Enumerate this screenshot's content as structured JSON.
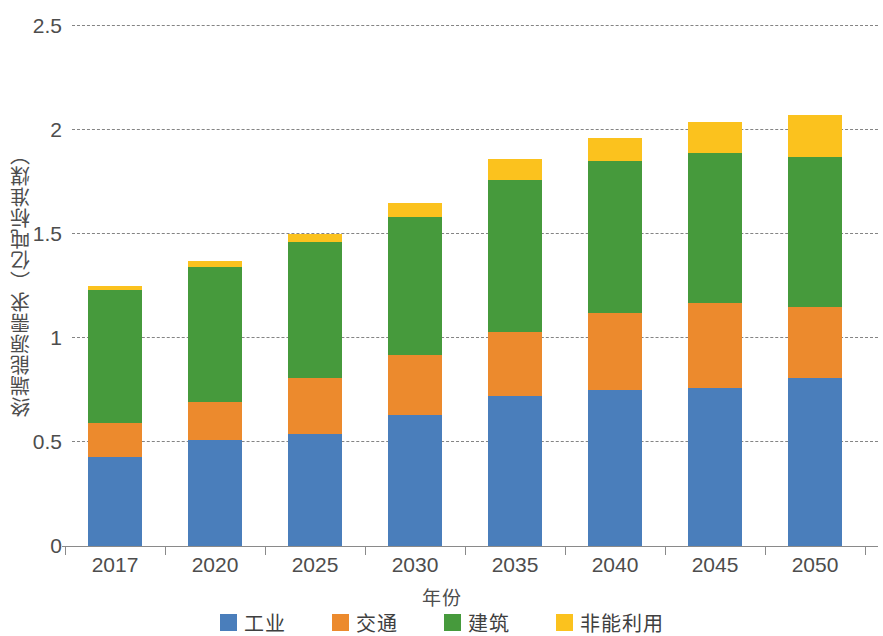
{
  "chart_data": {
    "type": "bar",
    "stacked": true,
    "title": "",
    "xlabel": "年份",
    "ylabel": "终端能源需求（亿吨标准煤）",
    "categories": [
      "2017",
      "2020",
      "2025",
      "2030",
      "2035",
      "2040",
      "2045",
      "2050"
    ],
    "ylim": [
      0,
      2.5
    ],
    "yticks": [
      0,
      0.5,
      1,
      1.5,
      2,
      2.5
    ],
    "ytick_labels": [
      "0",
      "0.5",
      "1",
      "1.5",
      "2",
      "2.5"
    ],
    "grid": true,
    "grid_axis": "y",
    "legend_position": "bottom",
    "series": [
      {
        "name": "工业",
        "color": "#4a7ebb",
        "values": [
          0.43,
          0.51,
          0.54,
          0.63,
          0.72,
          0.75,
          0.76,
          0.81
        ]
      },
      {
        "name": "交通",
        "color": "#ec8a2d",
        "values": [
          0.16,
          0.18,
          0.27,
          0.29,
          0.31,
          0.37,
          0.41,
          0.34
        ]
      },
      {
        "name": "建筑",
        "color": "#469a3c",
        "values": [
          0.64,
          0.65,
          0.65,
          0.66,
          0.73,
          0.73,
          0.72,
          0.72
        ]
      },
      {
        "name": "非能利用",
        "color": "#fbc21e",
        "values": [
          0.02,
          0.03,
          0.04,
          0.07,
          0.1,
          0.11,
          0.15,
          0.2
        ]
      }
    ],
    "totals": [
      1.25,
      1.37,
      1.5,
      1.65,
      1.86,
      1.96,
      2.04,
      2.07
    ]
  },
  "axes": {
    "y_title": "终端能源需求（亿吨标准煤）",
    "x_title": "年份"
  },
  "legend": {
    "items": [
      {
        "label": "工业",
        "color": "#4a7ebb"
      },
      {
        "label": "交通",
        "color": "#ec8a2d"
      },
      {
        "label": "建筑",
        "color": "#469a3c"
      },
      {
        "label": "非能利用",
        "color": "#fbc21e"
      }
    ]
  }
}
